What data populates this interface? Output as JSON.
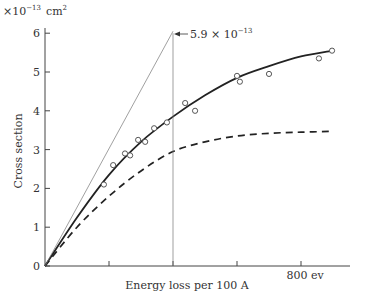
{
  "chart_data": {
    "type": "line",
    "title": "",
    "xlabel": "Energy loss per 100 A",
    "ylabel": "Cross section",
    "y_unit_label": "×10⁻¹³ cm²",
    "x_tick_labels": [
      "0",
      "",
      "",
      "",
      "800 ev"
    ],
    "x_ticks": [
      0,
      200,
      400,
      600,
      800
    ],
    "y_ticks": [
      0,
      1,
      2,
      3,
      4,
      5,
      6
    ],
    "y_tick_labels": [
      "0",
      "1",
      "2",
      "3",
      "4",
      "5",
      "6"
    ],
    "xlim": [
      0,
      930
    ],
    "ylim": [
      0,
      6.2
    ],
    "grid": false,
    "annotations": [
      {
        "text": "5.9 × 10⁻¹³",
        "x": 400,
        "y": 5.9,
        "type": "arrow",
        "note": "intercept of initial-slope tangent with vertical line at 400 ev"
      }
    ],
    "series": [
      {
        "name": "measured",
        "style": "scatter-open-circles",
        "x": [
          184,
          213,
          250,
          266,
          291,
          313,
          341,
          381,
          438,
          469,
          600,
          609,
          700,
          856,
          897
        ],
        "y": [
          2.1,
          2.6,
          2.9,
          2.85,
          3.25,
          3.2,
          3.55,
          3.7,
          4.2,
          4.0,
          4.9,
          4.75,
          4.95,
          5.35,
          5.55
        ]
      },
      {
        "name": "fitted curve",
        "style": "solid-thick",
        "x": [
          0,
          100,
          200,
          300,
          400,
          500,
          600,
          700,
          800,
          900
        ],
        "y": [
          0,
          1.25,
          2.35,
          3.2,
          3.85,
          4.4,
          4.85,
          5.15,
          5.4,
          5.55
        ]
      },
      {
        "name": "dashed curve",
        "style": "dashed",
        "x": [
          0,
          100,
          200,
          300,
          400,
          500,
          600,
          700,
          800,
          900
        ],
        "y": [
          0,
          1.0,
          1.8,
          2.45,
          2.95,
          3.2,
          3.35,
          3.42,
          3.45,
          3.47
        ]
      },
      {
        "name": "initial slope tangent",
        "style": "solid-thin",
        "x": [
          0,
          400
        ],
        "y": [
          0,
          6.05
        ]
      },
      {
        "name": "vertical reference",
        "style": "solid-thin",
        "x": [
          400,
          400
        ],
        "y": [
          0,
          6.0
        ]
      }
    ]
  },
  "labels": {
    "y_unit_prefix": "×10",
    "y_unit_exp": "−13",
    "y_unit_cm": "cm",
    "y_unit_sq": "2",
    "annot_mantissa": "5.9 × 10",
    "annot_exp": "−13",
    "xlabel": "Energy loss per 100 A",
    "ylabel": "Cross section",
    "x_last_tick": "800 ev",
    "origin": "0"
  }
}
